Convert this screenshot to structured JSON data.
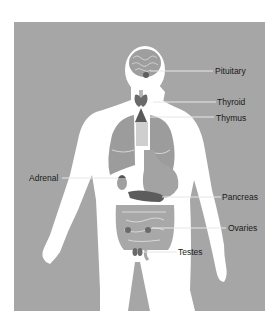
{
  "diagram": {
    "colors": {
      "background": "#a6a6a6",
      "body": "#ffffff",
      "organs": "#9a9a9a",
      "glands": "#5e5e5e",
      "leader_line": "#e6e6e6",
      "text": "#1a1a1a"
    },
    "labels": [
      {
        "id": "pituitary",
        "text": "Pituitary"
      },
      {
        "id": "thyroid",
        "text": "Thyroid"
      },
      {
        "id": "thymus",
        "text": "Thymus"
      },
      {
        "id": "adrenal",
        "text": "Adrenal"
      },
      {
        "id": "pancreas",
        "text": "Pancreas"
      },
      {
        "id": "ovaries",
        "text": "Ovaries"
      },
      {
        "id": "testes",
        "text": "Testes"
      }
    ]
  }
}
